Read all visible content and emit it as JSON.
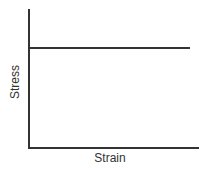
{
  "chart_data": {
    "type": "line",
    "title": "",
    "xlabel": "Strain",
    "ylabel": "Stress",
    "x": [
      0,
      1
    ],
    "series": [
      {
        "name": "stress-strain",
        "values": [
          0.73,
          0.73
        ]
      }
    ],
    "xlim": [
      0,
      1
    ],
    "ylim": [
      0,
      1
    ],
    "grid": false,
    "legend": null,
    "ticks": "none",
    "colors": {
      "line": "#333333",
      "axis": "#333333",
      "background": "#ffffff"
    }
  }
}
